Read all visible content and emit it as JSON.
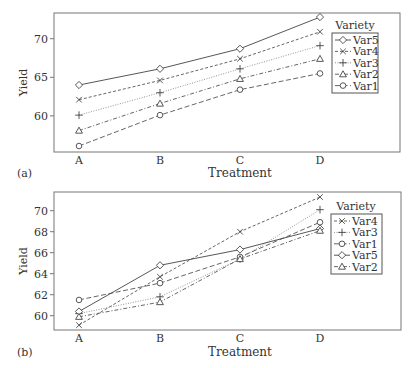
{
  "chart_data": [
    {
      "panel_label": "(a)",
      "type": "line",
      "title": "",
      "xlabel": "Treatment",
      "ylabel": "Yield",
      "categories": [
        "A",
        "B",
        "C",
        "D"
      ],
      "yticks": [
        60,
        65,
        70
      ],
      "ylim": [
        55.5,
        73.5
      ],
      "grid": false,
      "legend_title": "Variety",
      "legend_position": "upper right inside",
      "series": [
        {
          "name": "Var5",
          "marker": "diamond",
          "dash": "solid",
          "values": [
            64.0,
            66.1,
            68.7,
            72.8
          ]
        },
        {
          "name": "Var4",
          "marker": "x",
          "dash": "dashed",
          "values": [
            62.1,
            64.6,
            67.4,
            70.9
          ]
        },
        {
          "name": "Var3",
          "marker": "plus",
          "dash": "dotted",
          "values": [
            60.1,
            63.0,
            66.1,
            69.1
          ]
        },
        {
          "name": "Var2",
          "marker": "triangle",
          "dash": "dashdot",
          "values": [
            58.1,
            61.6,
            64.8,
            67.4
          ]
        },
        {
          "name": "Var1",
          "marker": "circle",
          "dash": "longdash",
          "values": [
            56.1,
            60.1,
            63.4,
            65.5
          ]
        }
      ]
    },
    {
      "panel_label": "(b)",
      "type": "line",
      "title": "",
      "xlabel": "Treatment",
      "ylabel": "Yield",
      "categories": [
        "A",
        "B",
        "C",
        "D"
      ],
      "yticks": [
        60,
        62,
        64,
        66,
        68,
        70
      ],
      "ylim": [
        58.7,
        71.8
      ],
      "grid": false,
      "legend_title": "Variety",
      "legend_position": "upper right inside",
      "series": [
        {
          "name": "Var4",
          "marker": "x",
          "dash": "dashed",
          "values": [
            59.1,
            63.7,
            68.0,
            71.3
          ]
        },
        {
          "name": "Var3",
          "marker": "plus",
          "dash": "dotted",
          "values": [
            60.2,
            61.8,
            65.4,
            70.1
          ]
        },
        {
          "name": "Var1",
          "marker": "circle",
          "dash": "longdash",
          "values": [
            61.5,
            63.1,
            65.6,
            68.9
          ]
        },
        {
          "name": "Var5",
          "marker": "diamond",
          "dash": "solid",
          "values": [
            60.4,
            64.8,
            66.3,
            68.3
          ]
        },
        {
          "name": "Var2",
          "marker": "triangle",
          "dash": "dashdot",
          "values": [
            59.9,
            61.3,
            65.4,
            68.1
          ]
        }
      ]
    }
  ]
}
